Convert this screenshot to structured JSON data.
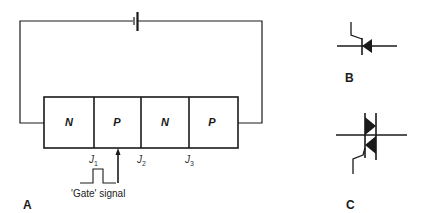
{
  "panel_a": {
    "label": "A",
    "regions": [
      {
        "text": "N"
      },
      {
        "text": "P"
      },
      {
        "text": "N"
      },
      {
        "text": "P"
      }
    ],
    "junctions": [
      {
        "letter": "J",
        "sub": "1"
      },
      {
        "letter": "J",
        "sub": "2"
      },
      {
        "letter": "J",
        "sub": "3"
      }
    ],
    "gate_caption": "'Gate' signal"
  },
  "panel_b": {
    "label": "B",
    "symbol": "thyristor-scr-symbol"
  },
  "panel_c": {
    "label": "C",
    "symbol": "triac-symbol"
  },
  "colors": {
    "line": "#1a1a1a",
    "background": "#ffffff"
  }
}
